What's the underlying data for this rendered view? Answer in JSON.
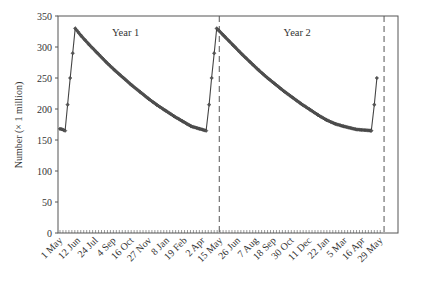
{
  "chart_data": {
    "type": "line",
    "title": "",
    "xlabel": "",
    "ylabel": "Number (× 1 million)",
    "ylim": [
      0,
      350
    ],
    "yticks": [
      0,
      50,
      100,
      150,
      200,
      250,
      300,
      350
    ],
    "grid": false,
    "legend": null,
    "x_tick_labels": [
      "1 May",
      "12 Jun",
      "24 Jul",
      "4 Sep",
      "16 Oct",
      "27 Nov",
      "8 Jan",
      "19 Feb",
      "2 Apr",
      "15 May",
      "26 Jun",
      "7 Aug",
      "18 Sep",
      "30 Oct",
      "11 Dec",
      "22 Jan",
      "5 Mar",
      "16 Apr",
      "29 May"
    ],
    "x_tick_spacing_days": 42,
    "annotations": [
      {
        "text": "Year 1",
        "day": 155,
        "value": 318
      },
      {
        "text": "Year 2",
        "day": 560,
        "value": 318
      }
    ],
    "vlines": [
      {
        "day": 376,
        "style": "dashed"
      },
      {
        "day": 765,
        "style": "dashed"
      }
    ],
    "series": [
      {
        "name": "Population",
        "marker": "diamond",
        "points": [
          [
            0,
            168
          ],
          [
            6,
            167
          ],
          [
            12,
            165
          ],
          [
            18,
            207
          ],
          [
            24,
            250
          ],
          [
            30,
            290
          ],
          [
            36,
            330
          ],
          [
            50,
            318
          ],
          [
            70,
            303
          ],
          [
            90,
            289
          ],
          [
            110,
            275
          ],
          [
            130,
            262
          ],
          [
            150,
            250
          ],
          [
            170,
            238
          ],
          [
            190,
            227
          ],
          [
            210,
            216
          ],
          [
            230,
            206
          ],
          [
            250,
            197
          ],
          [
            270,
            188
          ],
          [
            290,
            180
          ],
          [
            310,
            172
          ],
          [
            330,
            168
          ],
          [
            345,
            165
          ],
          [
            352,
            207
          ],
          [
            358,
            250
          ],
          [
            364,
            290
          ],
          [
            370,
            330
          ],
          [
            390,
            316
          ],
          [
            410,
            302
          ],
          [
            430,
            288
          ],
          [
            450,
            275
          ],
          [
            470,
            262
          ],
          [
            490,
            250
          ],
          [
            510,
            239
          ],
          [
            530,
            228
          ],
          [
            550,
            218
          ],
          [
            570,
            208
          ],
          [
            590,
            199
          ],
          [
            610,
            190
          ],
          [
            630,
            182
          ],
          [
            650,
            176
          ],
          [
            670,
            172
          ],
          [
            700,
            167
          ],
          [
            735,
            165
          ],
          [
            742,
            207
          ],
          [
            748,
            250
          ]
        ]
      }
    ]
  }
}
